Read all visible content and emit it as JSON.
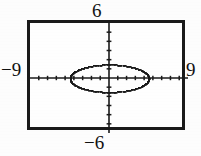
{
  "figure": {
    "kind": "graphing-calculator-viewing-window",
    "background_color": "#fdfdfd",
    "ink_color": "#1a1a1a"
  },
  "labels": {
    "top": "6",
    "bottom": "−6",
    "left": "−9",
    "right": "9"
  },
  "chart_data": {
    "type": "scatter",
    "title": "",
    "subtitle": "",
    "xlabel": "",
    "ylabel": "",
    "xlim": [
      -9,
      9
    ],
    "ylim": [
      -6,
      6
    ],
    "grid": false,
    "legend": null,
    "legend_position": "none",
    "axes": {
      "x_axis_drawn": true,
      "y_axis_drawn": true,
      "x_tick_spacing": 1,
      "y_tick_spacing": 1,
      "x_tick_values": [
        -8,
        -7,
        -6,
        -5,
        -4,
        -3,
        -2,
        -1,
        1,
        2,
        3,
        4,
        5,
        6,
        7,
        8
      ],
      "y_tick_values": [
        -5,
        -4,
        -3,
        -2,
        -1,
        1,
        2,
        3,
        4,
        5
      ],
      "tick_style": "hash-marks",
      "tick_labels_shown": false
    },
    "range_labels": {
      "xmin": -9,
      "xmax": 9,
      "ymin": -6,
      "ymax": 6
    },
    "series": [
      {
        "name": "ellipse",
        "curve_type": "ellipse",
        "render_style": "dotted-pixelated",
        "center": [
          0,
          0
        ],
        "semi_axis_x": 4.5,
        "semi_axis_y": 1.5,
        "x_intercepts": [
          -4.5,
          4.5
        ],
        "y_intercepts": [
          -1.5,
          1.5
        ],
        "points": [
          [
            4.5,
            0.0
          ],
          [
            4.46,
            0.2
          ],
          [
            4.35,
            0.39
          ],
          [
            4.17,
            0.56
          ],
          [
            3.93,
            0.73
          ],
          [
            3.64,
            0.88
          ],
          [
            3.3,
            1.02
          ],
          [
            2.92,
            1.14
          ],
          [
            2.5,
            1.25
          ],
          [
            2.05,
            1.33
          ],
          [
            1.57,
            1.4
          ],
          [
            1.07,
            1.46
          ],
          [
            0.55,
            1.49
          ],
          [
            0.0,
            1.5
          ],
          [
            -0.55,
            1.49
          ],
          [
            -1.07,
            1.46
          ],
          [
            -1.57,
            1.4
          ],
          [
            -2.05,
            1.33
          ],
          [
            -2.5,
            1.25
          ],
          [
            -2.92,
            1.14
          ],
          [
            -3.3,
            1.02
          ],
          [
            -3.64,
            0.88
          ],
          [
            -3.93,
            0.73
          ],
          [
            -4.17,
            0.56
          ],
          [
            -4.35,
            0.39
          ],
          [
            -4.46,
            0.2
          ],
          [
            -4.5,
            0.0
          ],
          [
            -4.46,
            -0.2
          ],
          [
            -4.35,
            -0.39
          ],
          [
            -4.17,
            -0.56
          ],
          [
            -3.93,
            -0.73
          ],
          [
            -3.64,
            -0.88
          ],
          [
            -3.3,
            -1.02
          ],
          [
            -2.92,
            -1.14
          ],
          [
            -2.5,
            -1.25
          ],
          [
            -2.05,
            -1.33
          ],
          [
            -1.57,
            -1.4
          ],
          [
            -1.07,
            -1.46
          ],
          [
            -0.55,
            -1.49
          ],
          [
            0.0,
            -1.5
          ],
          [
            0.55,
            -1.49
          ],
          [
            1.07,
            -1.46
          ],
          [
            1.57,
            -1.4
          ],
          [
            2.05,
            -1.33
          ],
          [
            2.5,
            -1.25
          ],
          [
            2.92,
            -1.14
          ],
          [
            3.3,
            -1.02
          ],
          [
            3.64,
            -0.88
          ],
          [
            3.93,
            -0.73
          ],
          [
            4.17,
            -0.56
          ],
          [
            4.35,
            -0.39
          ],
          [
            4.46,
            -0.2
          ]
        ]
      }
    ]
  }
}
